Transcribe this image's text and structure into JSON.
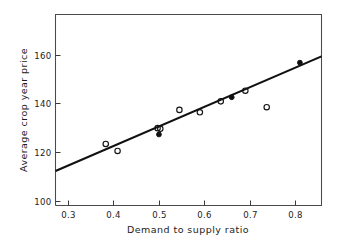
{
  "chart_data": {
    "type": "scatter",
    "title": "",
    "xlabel": "Demand to supply ratio",
    "ylabel": "Average crop year price",
    "xlim": [
      0.2725,
      0.8575
    ],
    "ylim": [
      98.0,
      176.5
    ],
    "xticks": [
      0.3,
      0.4,
      0.5,
      0.6,
      0.7,
      0.8
    ],
    "xtick_labels": [
      "0.3",
      "0.4",
      "0.5",
      "0.6",
      "0.7",
      "0.8"
    ],
    "yticks": [
      100,
      120,
      140,
      160
    ],
    "ytick_labels": [
      "100",
      "140",
      "120",
      "160"
    ],
    "ytick_labels_ordered": [
      "100",
      "120",
      "140",
      "160"
    ],
    "grid": false,
    "legend": null,
    "series": [
      {
        "name": "open-markers",
        "marker": "open-circle",
        "points": [
          {
            "x": 0.383,
            "y": 123.3
          },
          {
            "x": 0.409,
            "y": 120.4
          },
          {
            "x": 0.497,
            "y": 129.8
          },
          {
            "x": 0.503,
            "y": 129.5
          },
          {
            "x": 0.545,
            "y": 137.3
          },
          {
            "x": 0.59,
            "y": 136.3
          },
          {
            "x": 0.636,
            "y": 140.8
          },
          {
            "x": 0.69,
            "y": 145.2
          },
          {
            "x": 0.737,
            "y": 138.4
          }
        ]
      },
      {
        "name": "filled-markers",
        "marker": "filled-circle",
        "points": [
          {
            "x": 0.5,
            "y": 127.2
          },
          {
            "x": 0.66,
            "y": 142.5
          },
          {
            "x": 0.81,
            "y": 156.7
          }
        ]
      }
    ],
    "fit_line": {
      "name": "regression-line",
      "x_start": 0.2725,
      "y_start": 112.2,
      "x_end": 0.8575,
      "y_end": 159.3,
      "slope": 80.5,
      "intercept": 90.3
    }
  }
}
